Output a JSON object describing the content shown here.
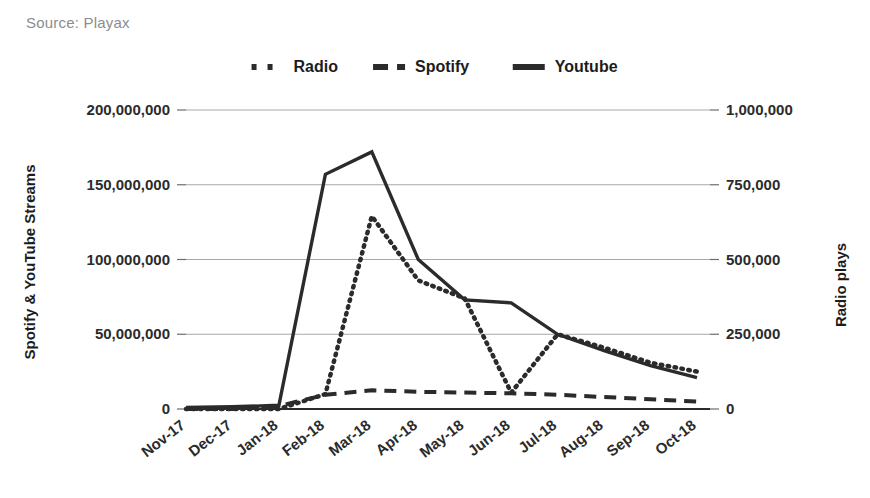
{
  "source_note": "Source: Playax",
  "legend": {
    "position": "top-center",
    "items": [
      {
        "label": "Radio",
        "style": "dotted",
        "color": "#2b2b2b"
      },
      {
        "label": "Spotify",
        "style": "dashed",
        "color": "#2b2b2b"
      },
      {
        "label": "Youtube",
        "style": "solid",
        "color": "#2b2b2b"
      }
    ]
  },
  "chart_data": {
    "type": "line",
    "title": "",
    "subtitle": "",
    "xlabel": "",
    "ylabel": "Spotify & YouTube Streams",
    "y2label": "Radio plays",
    "grid": true,
    "legend_position": "top-center",
    "categories": [
      "Nov-17",
      "Dec-17",
      "Jan-18",
      "Feb-18",
      "Mar-18",
      "Apr-18",
      "May-18",
      "Jun-18",
      "Jul-18",
      "Aug-18",
      "Sep-18",
      "Oct-18"
    ],
    "ylim": [
      0,
      200000000
    ],
    "y2lim": [
      0,
      1000000
    ],
    "yticks": [
      0,
      50000000,
      100000000,
      150000000,
      200000000
    ],
    "ytick_labels": [
      "0",
      "50,000,000",
      "100,000,000",
      "150,000,000",
      "200,000,000"
    ],
    "y2ticks": [
      0,
      250000,
      500000,
      750000,
      1000000
    ],
    "y2tick_labels": [
      "0",
      "250,000",
      "500,000",
      "750,000",
      "1,000,000"
    ],
    "series": [
      {
        "name": "Youtube",
        "axis": "left",
        "style": "solid",
        "color": "#2b2b2b",
        "values": [
          1000000,
          1500000,
          2500000,
          157000000,
          172000000,
          100000000,
          73000000,
          71000000,
          50000000,
          39000000,
          29000000,
          21000000
        ]
      },
      {
        "name": "Spotify",
        "axis": "left",
        "style": "dashed",
        "color": "#2b2b2b",
        "values": [
          0,
          0,
          2000000,
          9500000,
          12500000,
          11500000,
          11000000,
          10500000,
          9500000,
          8000000,
          6500000,
          5000000
        ]
      },
      {
        "name": "Radio",
        "axis": "right",
        "style": "dotted",
        "color": "#2b2b2b",
        "values": [
          0,
          0,
          0,
          50000,
          645000,
          430000,
          370000,
          55000,
          250000,
          205000,
          155000,
          125000
        ]
      }
    ]
  },
  "geometry": {
    "plot_left": 186,
    "plot_right": 710,
    "plot_top": 110,
    "plot_bottom": 409,
    "first_point_x": 186,
    "last_point_x": 697
  }
}
